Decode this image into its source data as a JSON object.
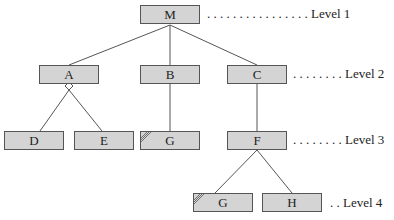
{
  "diagram": {
    "type": "tree",
    "nodes": [
      {
        "id": "M",
        "label": "M",
        "level": 1,
        "marked": false
      },
      {
        "id": "A",
        "label": "A",
        "level": 2,
        "marked": false
      },
      {
        "id": "B",
        "label": "B",
        "level": 2,
        "marked": false
      },
      {
        "id": "C",
        "label": "C",
        "level": 2,
        "marked": false
      },
      {
        "id": "D",
        "label": "D",
        "level": 3,
        "marked": false
      },
      {
        "id": "E",
        "label": "E",
        "level": 3,
        "marked": false
      },
      {
        "id": "G3",
        "label": "G",
        "level": 3,
        "marked": true
      },
      {
        "id": "F",
        "label": "F",
        "level": 3,
        "marked": false
      },
      {
        "id": "G4",
        "label": "G",
        "level": 4,
        "marked": true
      },
      {
        "id": "H",
        "label": "H",
        "level": 4,
        "marked": false
      }
    ],
    "edges": [
      [
        "M",
        "A"
      ],
      [
        "M",
        "B"
      ],
      [
        "M",
        "C"
      ],
      [
        "A",
        "D"
      ],
      [
        "A",
        "E"
      ],
      [
        "B",
        "G3"
      ],
      [
        "C",
        "F"
      ],
      [
        "F",
        "G4"
      ],
      [
        "F",
        "H"
      ]
    ],
    "levels": [
      {
        "label": ". . . . . . . . . . . . . . . . Level 1"
      },
      {
        "label": ". . . . . . . . Level 2"
      },
      {
        "label": ". . . . . . . . Level 3"
      },
      {
        "label": ". . Level 4"
      }
    ]
  }
}
